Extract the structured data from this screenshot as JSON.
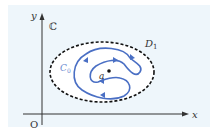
{
  "diagram": {
    "plane_label": "ℂ",
    "y_axis_label": "y",
    "x_axis_label": "x",
    "origin_label": "O",
    "region_label": "D",
    "region_subscript": "1",
    "curve_label": "C",
    "curve_subscript": "0",
    "point_label": "a",
    "colors": {
      "background": "#eef6fb",
      "axes": "#333333",
      "region_boundary": "#111111",
      "curve": "#4a6fc4",
      "curve_label": "#6a8ad0"
    }
  }
}
